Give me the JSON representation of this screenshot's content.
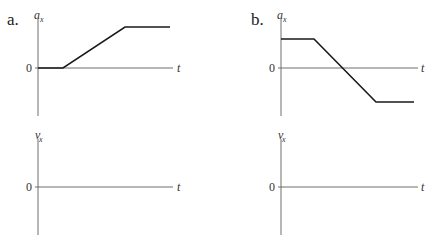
{
  "panels": [
    {
      "label": "a.",
      "accel_graph": {
        "y_var": "a",
        "y_sub": "x",
        "x_var": "t",
        "zero_label": "0",
        "curve_points": "38,68 63,68 125,27 170,27"
      },
      "velocity_graph": {
        "y_var": "v",
        "y_sub": "x",
        "x_var": "t",
        "zero_label": "0"
      }
    },
    {
      "label": "b.",
      "accel_graph": {
        "y_var": "a",
        "y_sub": "x",
        "x_var": "t",
        "zero_label": "0",
        "curve_points": "281,39 314,39 376,102 414,102"
      },
      "velocity_graph": {
        "y_var": "v",
        "y_sub": "x",
        "x_var": "t",
        "zero_label": "0"
      }
    }
  ],
  "colors": {
    "axis": "#6e6e6e",
    "curve": "#1a1a1a"
  }
}
